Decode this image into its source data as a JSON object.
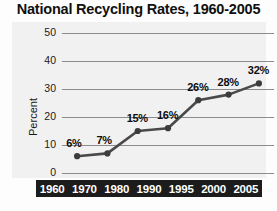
{
  "chart_data": {
    "type": "line",
    "title": "National Recycling Rates, 1960-2005",
    "xlabel": "",
    "ylabel": "Percent",
    "categories": [
      "1960",
      "1970",
      "1980",
      "1990",
      "1995",
      "2000",
      "2005"
    ],
    "values": [
      6,
      7,
      15,
      16,
      26,
      28,
      32
    ],
    "point_labels": [
      "6%",
      "7%",
      "15%",
      "16%",
      "26%",
      "28%",
      "32%"
    ],
    "yticks": [
      "50",
      "40",
      "30",
      "20",
      "10",
      "0"
    ],
    "ytick_values": [
      50,
      40,
      30,
      20,
      10,
      0
    ],
    "ylim": [
      0,
      50
    ],
    "grid": true,
    "legend": "none",
    "colors": {
      "line": "#4a4a4a",
      "marker": "#3c3c3c",
      "gridline": "#8c8c8c",
      "panel_background": "#f1f1f1",
      "axis_bar_background": "#1c1c1c",
      "axis_bar_text": "#ffffff",
      "title_text": "#101010",
      "label_text": "#0d0d0d"
    }
  }
}
